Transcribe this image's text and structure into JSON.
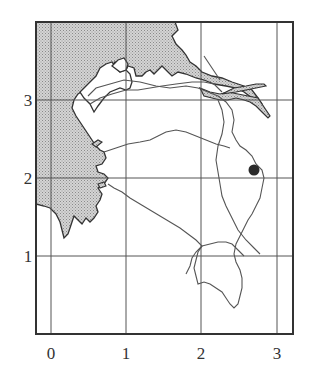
{
  "map": {
    "x_axis": {
      "ticks": [
        "0",
        "1",
        "2",
        "3"
      ]
    },
    "y_axis": {
      "ticks": [
        "1",
        "2",
        "3"
      ]
    },
    "features": {
      "land_shading": "stippled grey",
      "marker": {
        "shape": "filled-circle",
        "grid_x": 2.7,
        "grid_y": 2.1
      }
    },
    "colors": {
      "frame": "#333333",
      "grid": "#555555",
      "land": "#c8c8c8",
      "coast": "#333333",
      "route": "#666666",
      "marker": "#2a2a2a"
    }
  }
}
